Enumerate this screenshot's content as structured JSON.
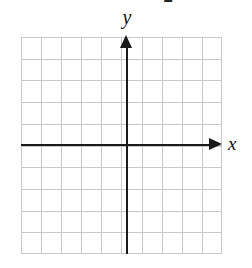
{
  "figure": {
    "name": "blank-cartesian-coordinate-grid",
    "background_color": "#ffffff",
    "top_fragment_text": "2",
    "axis_labels": {
      "x": "x",
      "y": "y"
    },
    "icons": {
      "x_arrowhead": "arrow-right-icon",
      "y_arrowhead": "arrow-up-icon"
    }
  },
  "chart_data": {
    "type": "scatter",
    "title": "",
    "subtitle": "",
    "xlabel": "x",
    "ylabel": "y",
    "x": [],
    "values": [],
    "series": [],
    "categories": [],
    "xlim": [
      -5,
      5
    ],
    "ylim": [
      -5,
      5
    ],
    "xticks": [
      -5,
      -4,
      -3,
      -2,
      -1,
      0,
      1,
      2,
      3,
      4,
      5
    ],
    "yticks": [
      -5,
      -4,
      -3,
      -2,
      -1,
      0,
      1,
      2,
      3,
      4,
      5
    ],
    "xtick_labels": [
      "",
      "",
      "",
      "",
      "",
      "",
      "",
      "",
      "",
      "",
      ""
    ],
    "ytick_labels": [
      "",
      "",
      "",
      "",
      "",
      "",
      "",
      "",
      "",
      "",
      ""
    ],
    "grid": true,
    "grid_columns": 10,
    "grid_rows": 10,
    "grid_color": "#c9c9c9",
    "axis_color": "#1a1a1a",
    "legend": [],
    "legend_position": "none",
    "annotations": []
  }
}
